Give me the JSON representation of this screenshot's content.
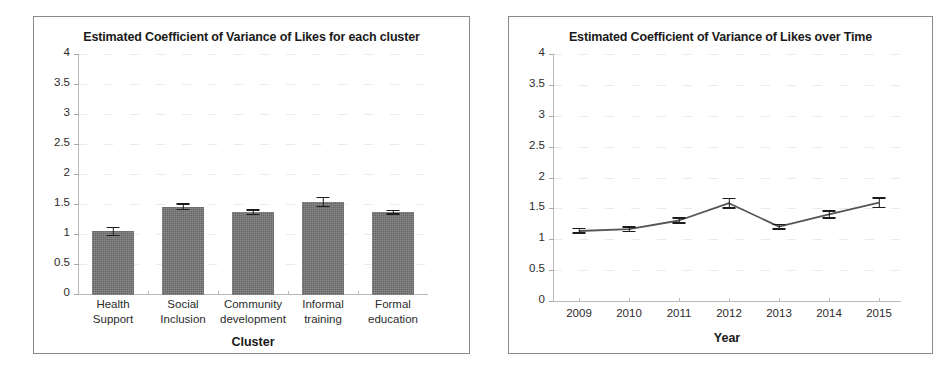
{
  "chart_data": [
    {
      "type": "bar",
      "title": "Estimated Coefficient of Variance of Likes for each cluster",
      "xlabel": "Cluster",
      "ylabel": "",
      "ylim": [
        0,
        4
      ],
      "yticks": [
        "0",
        "0.5",
        "1",
        "1.5",
        "2",
        "2.5",
        "3",
        "3.5",
        "4"
      ],
      "grid": true,
      "legend": "none",
      "categories": [
        "Health Support",
        "Social Inclusion",
        "Community development",
        "Informal training",
        "Formal education"
      ],
      "values": [
        1.06,
        1.47,
        1.38,
        1.55,
        1.38
      ],
      "errors": [
        0.08,
        0.06,
        0.05,
        0.09,
        0.04
      ]
    },
    {
      "type": "line",
      "title": "Estimated Coefficient of Variance  of Likes over Time",
      "xlabel": "Year",
      "ylabel": "",
      "ylim": [
        0,
        4
      ],
      "yticks": [
        "0",
        "0.5",
        "1",
        "1.5",
        "2",
        "2.5",
        "3",
        "3.5",
        "4"
      ],
      "grid": true,
      "legend": "none",
      "x": [
        "2009",
        "2010",
        "2011",
        "2012",
        "2013",
        "2014",
        "2015"
      ],
      "values": [
        1.15,
        1.18,
        1.32,
        1.6,
        1.22,
        1.42,
        1.61
      ],
      "errors": [
        0.05,
        0.05,
        0.05,
        0.09,
        0.05,
        0.07,
        0.09
      ]
    }
  ],
  "figure": {
    "panel_left_title": "Estimated Coefficient of Variance of Likes for each cluster",
    "panel_right_title": "Estimated Coefficient of Variance  of Likes over Time",
    "bar_color": "#717171",
    "error_color": "#1c1c1c",
    "line_color": "#555555",
    "axis_color": "#b9b9b9",
    "frame_color": "#8a8a8a"
  }
}
